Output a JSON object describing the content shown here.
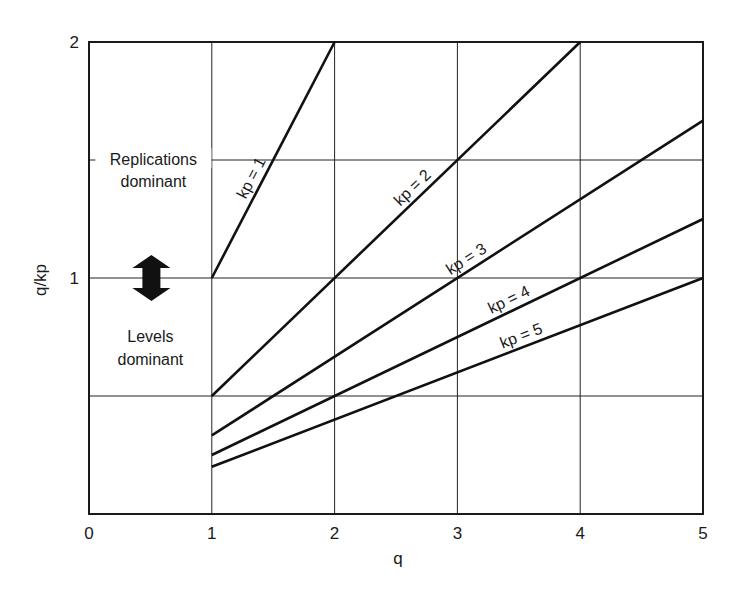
{
  "chart_data": {
    "type": "line",
    "title": "",
    "xlabel": "q",
    "ylabel": "q/kp",
    "xlim": [
      0,
      5
    ],
    "ylim": [
      0,
      2
    ],
    "x_ticks": [
      0,
      1,
      2,
      3,
      4,
      5
    ],
    "y_ticks": [
      1,
      2
    ],
    "grid": {
      "x": [
        1,
        2,
        3,
        4
      ],
      "y": [
        0.5,
        1,
        1.5
      ]
    },
    "legend": "none (inline labels)",
    "series": [
      {
        "name": "kp = 1",
        "kp": 1,
        "x": [
          1,
          2
        ],
        "y": [
          1,
          2
        ]
      },
      {
        "name": "kp = 2",
        "kp": 2,
        "x": [
          1,
          4
        ],
        "y": [
          0.5,
          2
        ]
      },
      {
        "name": "kp = 3",
        "kp": 3,
        "x": [
          1,
          5
        ],
        "y": [
          0.333,
          1.667
        ]
      },
      {
        "name": "kp = 4",
        "kp": 4,
        "x": [
          1,
          5
        ],
        "y": [
          0.25,
          1.25
        ]
      },
      {
        "name": "kp = 5",
        "kp": 5,
        "x": [
          1,
          5
        ],
        "y": [
          0.2,
          1.0
        ]
      }
    ],
    "annotations": [
      {
        "text": "Replications dominant",
        "x": 0.5,
        "y": 1.6
      },
      {
        "text": "Levels dominant",
        "x": 0.5,
        "y": 0.7
      },
      {
        "text": "double-headed arrow",
        "x": 0.5,
        "y": 1.0
      }
    ]
  },
  "labels": {
    "xlabel": "q",
    "ylabel": "q/kp",
    "replications_line1": "Replications",
    "replications_line2": "dominant",
    "levels_line1": "Levels",
    "levels_line2": "dominant"
  },
  "layout": {
    "plot": {
      "left": 89,
      "right": 703,
      "top": 42,
      "bottom": 514
    },
    "line_color": "#111111",
    "grid_color": "#222222"
  }
}
